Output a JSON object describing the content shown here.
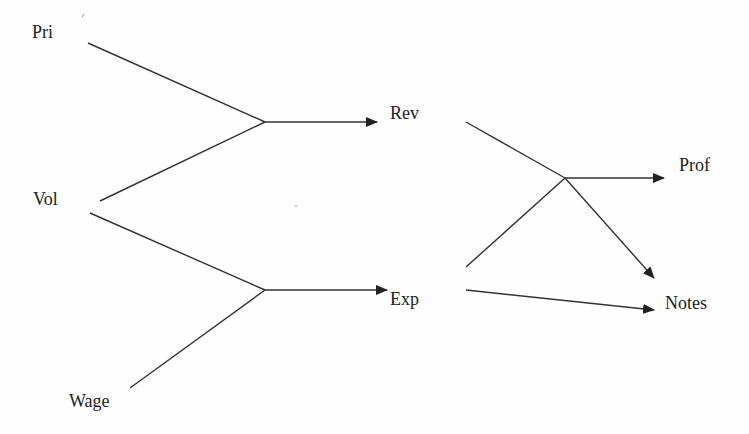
{
  "diagram": {
    "type": "flow-tree",
    "nodes": [
      {
        "id": "pri",
        "label": "Pri",
        "x": 32,
        "y": 23
      },
      {
        "id": "vol",
        "label": "Vol",
        "x": 33,
        "y": 190
      },
      {
        "id": "wage",
        "label": "Wage",
        "x": 69,
        "y": 392
      },
      {
        "id": "rev",
        "label": "Rev",
        "x": 390,
        "y": 104
      },
      {
        "id": "exp",
        "label": "Exp",
        "x": 390,
        "y": 290
      },
      {
        "id": "prof",
        "label": "Prof",
        "x": 679,
        "y": 156
      },
      {
        "id": "notes",
        "label": "Notes",
        "x": 665,
        "y": 294
      }
    ],
    "edges": [
      {
        "from": "pri",
        "to": "rev",
        "via": "junction-1"
      },
      {
        "from": "vol",
        "to": "rev",
        "via": "junction-1"
      },
      {
        "from": "vol",
        "to": "exp",
        "via": "junction-2"
      },
      {
        "from": "wage",
        "to": "exp",
        "via": "junction-2"
      },
      {
        "from": "rev",
        "to": "prof",
        "via": "junction-3"
      },
      {
        "from": "exp",
        "to": "prof",
        "via": "junction-3"
      },
      {
        "from": "junction-3",
        "to": "notes"
      },
      {
        "from": "exp",
        "to": "notes"
      }
    ],
    "colors": {
      "line": "#333333",
      "text": "#222222",
      "background": "#fefefe"
    }
  }
}
